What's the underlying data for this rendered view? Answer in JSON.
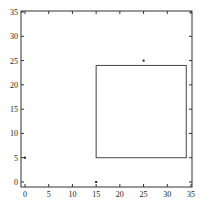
{
  "chart_data": {
    "type": "scatter",
    "title": "",
    "xlabel": "",
    "ylabel": "",
    "xlim": [
      0,
      35
    ],
    "ylim": [
      0,
      35
    ],
    "grid": false,
    "legend": null,
    "xticks": [
      0,
      5,
      10,
      15,
      20,
      25,
      30,
      35
    ],
    "yticks": [
      0,
      5,
      10,
      15,
      20,
      25,
      30,
      35
    ],
    "points": [
      {
        "x": 0,
        "y": 5
      },
      {
        "x": 15,
        "y": 0
      },
      {
        "x": 25,
        "y": 25
      }
    ],
    "rectangles": [
      {
        "x0": 15,
        "y0": 5,
        "x1": 34,
        "y1": 24
      }
    ]
  },
  "colors": {
    "axis": "#333333",
    "rect": "#444444",
    "point": "#222222"
  }
}
